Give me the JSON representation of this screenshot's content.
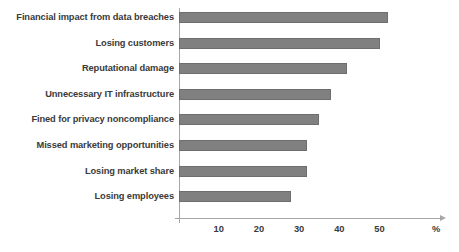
{
  "chart_data": {
    "type": "bar",
    "orientation": "horizontal",
    "title": "",
    "xlabel": "%",
    "ylabel": "",
    "xlim": [
      0,
      60
    ],
    "grid": false,
    "legend": null,
    "bar_color": "#808080",
    "text_color": "#3a3a3a",
    "axis_color": "#a6a6a6",
    "categories": [
      "Financial impact from data breaches",
      "Losing customers",
      "Reputational damage",
      "Unnecessary IT infrastructure",
      "Fined for privacy noncompliance",
      "Missed marketing opportunities",
      "Losing market share",
      "Losing employees"
    ],
    "values": [
      52,
      50,
      42,
      38,
      35,
      32,
      32,
      28
    ],
    "xticks": [
      10,
      20,
      30,
      40,
      50
    ],
    "xtick_labels": [
      "10",
      "20",
      "30",
      "40",
      "50"
    ],
    "unit_label": "%"
  }
}
